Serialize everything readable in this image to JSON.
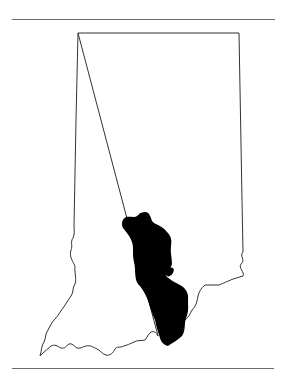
{
  "map": {
    "subject": "Indiana state outline",
    "highlighted_region": "south-central band (filled black)",
    "colors": {
      "background": "#ffffff",
      "outline": "#333333",
      "fill": "#000000",
      "rule": "#6a6a6a"
    }
  }
}
